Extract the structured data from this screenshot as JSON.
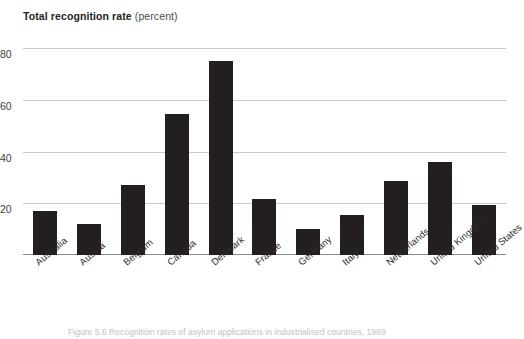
{
  "axis_title": {
    "bold_text": "Total recognition rate",
    "unit_text": " (percent)"
  },
  "caption": "Figure 5.6  Recognition rates of asylum applications in industrialised countries, 1989",
  "colors": {
    "bar": "#231f20",
    "gridline": "#c9c9c9",
    "baseline": "#8c8c8c",
    "text": "#231f20",
    "caption": "#c2c2c2"
  },
  "chart_data": {
    "type": "bar",
    "title": "Total recognition rate (percent)",
    "xlabel": "",
    "ylabel": "Total recognition rate (percent)",
    "ylim": [
      0,
      80
    ],
    "yticks": [
      20,
      40,
      60,
      80
    ],
    "grid": true,
    "legend": null,
    "categories": [
      "Australia",
      "Austria",
      "Belgium",
      "Canada",
      "Denmark",
      "France",
      "Germany",
      "Italy",
      "Netherlands",
      "United Kingdom",
      "United States"
    ],
    "values": [
      17,
      12,
      27,
      54.5,
      75,
      21.5,
      10,
      15.5,
      28.5,
      36,
      19.5
    ]
  }
}
